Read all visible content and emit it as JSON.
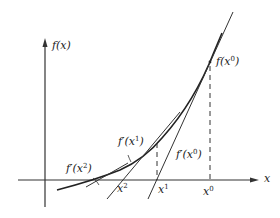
{
  "diagram": {
    "axes": {
      "y_label": "f(x)",
      "x_label": "x"
    },
    "points": [
      {
        "name": "x0",
        "base": "x",
        "sup": "0"
      },
      {
        "name": "x1",
        "base": "x",
        "sup": "1"
      },
      {
        "name": "x2",
        "base": "x",
        "sup": "2"
      }
    ],
    "labels": {
      "f_x0": {
        "base": "f(x",
        "sup": "0",
        "close": ")"
      },
      "fp_x0": {
        "base": "f′(x",
        "sup": "0",
        "close": ")"
      },
      "fp_x1": {
        "base": "f′(x",
        "sup": "1",
        "close": ")"
      },
      "fp_x2": {
        "base": "f′(x",
        "sup": "2",
        "close": ")"
      }
    },
    "colors": {
      "stroke": "#222222",
      "background": "#ffffff"
    }
  }
}
